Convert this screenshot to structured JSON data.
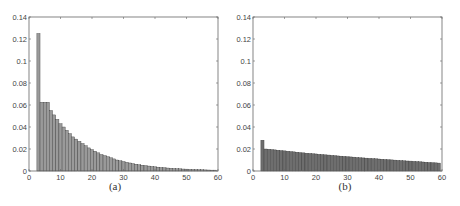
{
  "chart_data": [
    {
      "id": "a",
      "type": "bar",
      "title": "",
      "caption": "(a)",
      "xlabel": "",
      "ylabel": "",
      "xlim": [
        0,
        60
      ],
      "ylim": [
        0,
        0.14
      ],
      "xticks": [
        0,
        10,
        20,
        30,
        40,
        50,
        60
      ],
      "yticks": [
        0,
        0.02,
        0.04,
        0.06,
        0.08,
        0.1,
        0.12,
        0.14
      ],
      "ytick_labels": [
        "0",
        "0.02",
        "0.04",
        "0.06",
        "0.08",
        "0.1",
        "0.12",
        "0.14"
      ],
      "grid": false,
      "bar_color": "#9a9a9a",
      "x": [
        3,
        4,
        5,
        6,
        7,
        8,
        9,
        10,
        11,
        12,
        13,
        14,
        15,
        16,
        17,
        18,
        19,
        20,
        21,
        22,
        23,
        24,
        25,
        26,
        27,
        28,
        29,
        30,
        31,
        32,
        33,
        34,
        35,
        36,
        37,
        38,
        39,
        40,
        41,
        42,
        43,
        44,
        45,
        46,
        47,
        48,
        49,
        50,
        51,
        52,
        53,
        54,
        55,
        56,
        57,
        58,
        59
      ],
      "values": [
        0.125,
        0.0625,
        0.0625,
        0.0625,
        0.055,
        0.051,
        0.047,
        0.043,
        0.04,
        0.037,
        0.034,
        0.031,
        0.029,
        0.027,
        0.025,
        0.023,
        0.021,
        0.0195,
        0.018,
        0.0165,
        0.015,
        0.014,
        0.013,
        0.012,
        0.011,
        0.01,
        0.0093,
        0.0086,
        0.0079,
        0.0073,
        0.0067,
        0.0062,
        0.0057,
        0.0053,
        0.0049,
        0.0045,
        0.0041,
        0.0038,
        0.0035,
        0.0032,
        0.003,
        0.0027,
        0.0025,
        0.0023,
        0.0021,
        0.002,
        0.0018,
        0.0017,
        0.0015,
        0.0014,
        0.0013,
        0.0012,
        0.0011,
        0.001,
        0.0009,
        0.0008,
        0.0008
      ]
    },
    {
      "id": "b",
      "type": "bar",
      "title": "",
      "caption": "(b)",
      "xlabel": "",
      "ylabel": "",
      "xlim": [
        0,
        60
      ],
      "ylim": [
        0,
        0.14
      ],
      "xticks": [
        0,
        10,
        20,
        30,
        40,
        50,
        60
      ],
      "yticks": [
        0,
        0.02,
        0.04,
        0.06,
        0.08,
        0.1,
        0.12,
        0.14
      ],
      "ytick_labels": [
        "0",
        "0.02",
        "0.04",
        "0.06",
        "0.08",
        "0.1",
        "0.12",
        "0.14"
      ],
      "grid": false,
      "bar_color": "#6e6e6e",
      "x": [
        3,
        4,
        5,
        6,
        7,
        8,
        9,
        10,
        11,
        12,
        13,
        14,
        15,
        16,
        17,
        18,
        19,
        20,
        21,
        22,
        23,
        24,
        25,
        26,
        27,
        28,
        29,
        30,
        31,
        32,
        33,
        34,
        35,
        36,
        37,
        38,
        39,
        40,
        41,
        42,
        43,
        44,
        45,
        46,
        47,
        48,
        49,
        50,
        51,
        52,
        53,
        54,
        55,
        56,
        57,
        58,
        59
      ],
      "values": [
        0.028,
        0.02,
        0.0198,
        0.0195,
        0.0192,
        0.0189,
        0.0186,
        0.0183,
        0.018,
        0.0177,
        0.0174,
        0.0171,
        0.0168,
        0.0165,
        0.0162,
        0.016,
        0.0157,
        0.0155,
        0.0152,
        0.015,
        0.0147,
        0.0145,
        0.0142,
        0.014,
        0.0137,
        0.0135,
        0.0133,
        0.013,
        0.0128,
        0.0126,
        0.0123,
        0.0121,
        0.0119,
        0.0117,
        0.0115,
        0.0113,
        0.0111,
        0.0109,
        0.0107,
        0.0105,
        0.0103,
        0.0101,
        0.0099,
        0.0097,
        0.0095,
        0.0093,
        0.0091,
        0.009,
        0.0088,
        0.0086,
        0.0084,
        0.0082,
        0.008,
        0.0078,
        0.0076,
        0.0074,
        0.0072
      ]
    }
  ]
}
